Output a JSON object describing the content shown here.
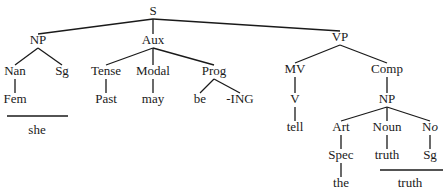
{
  "diagram": {
    "type": "syntax-tree",
    "nodes": [
      {
        "id": "S",
        "label": "S",
        "x": 153,
        "y": 12
      },
      {
        "id": "NP1",
        "label": "NP",
        "x": 38,
        "y": 41
      },
      {
        "id": "Aux",
        "label": "Aux",
        "x": 153,
        "y": 41
      },
      {
        "id": "VP",
        "label": "VP",
        "x": 340,
        "y": 38
      },
      {
        "id": "Nan",
        "label": "Nan",
        "x": 15,
        "y": 72
      },
      {
        "id": "Sg1",
        "label": "Sg",
        "x": 62,
        "y": 72
      },
      {
        "id": "Tense",
        "label": "Tense",
        "x": 106,
        "y": 72
      },
      {
        "id": "Modal",
        "label": "Modal",
        "x": 153,
        "y": 72
      },
      {
        "id": "Prog",
        "label": "Prog",
        "x": 214,
        "y": 72
      },
      {
        "id": "MV",
        "label": "MV",
        "x": 295,
        "y": 70
      },
      {
        "id": "Comp",
        "label": "Comp",
        "x": 387,
        "y": 70
      },
      {
        "id": "Fem",
        "label": "Fem",
        "x": 15,
        "y": 100
      },
      {
        "id": "Past",
        "label": "Past",
        "x": 106,
        "y": 100
      },
      {
        "id": "may",
        "label": "may",
        "x": 153,
        "y": 100
      },
      {
        "id": "be",
        "label": "be",
        "x": 200,
        "y": 100
      },
      {
        "id": "ING",
        "label": "-ING",
        "x": 240,
        "y": 100
      },
      {
        "id": "V",
        "label": "V",
        "x": 295,
        "y": 100
      },
      {
        "id": "NP2",
        "label": "NP",
        "x": 387,
        "y": 100
      },
      {
        "id": "tell",
        "label": "tell",
        "x": 295,
        "y": 128
      },
      {
        "id": "Art",
        "label": "Art",
        "x": 341,
        "y": 128
      },
      {
        "id": "Noun",
        "label": "Noun",
        "x": 387,
        "y": 128
      },
      {
        "id": "No",
        "label": "N",
        "label_suffix_italic": "o",
        "x": 430,
        "y": 128
      },
      {
        "id": "Spec",
        "label": "Spec",
        "x": 341,
        "y": 156
      },
      {
        "id": "truth1",
        "label": "truth",
        "x": 387,
        "y": 156
      },
      {
        "id": "Sg2",
        "label": "Sg",
        "x": 430,
        "y": 156
      },
      {
        "id": "the",
        "label": "the",
        "x": 341,
        "y": 184
      },
      {
        "id": "she",
        "label": "she",
        "x": 37,
        "y": 131
      },
      {
        "id": "truth2",
        "label": "truth",
        "x": 410,
        "y": 184
      }
    ],
    "edges": [
      [
        "S",
        "NP1"
      ],
      [
        "S",
        "Aux"
      ],
      [
        "S",
        "VP"
      ],
      [
        "NP1",
        "Nan"
      ],
      [
        "NP1",
        "Sg1"
      ],
      [
        "Aux",
        "Tense"
      ],
      [
        "Aux",
        "Modal"
      ],
      [
        "Aux",
        "Prog"
      ],
      [
        "VP",
        "MV"
      ],
      [
        "VP",
        "Comp"
      ],
      [
        "Nan",
        "Fem"
      ],
      [
        "Tense",
        "Past"
      ],
      [
        "Modal",
        "may"
      ],
      [
        "Prog",
        "be"
      ],
      [
        "Prog",
        "ING"
      ],
      [
        "MV",
        "V"
      ],
      [
        "Comp",
        "NP2"
      ],
      [
        "V",
        "tell"
      ],
      [
        "NP2",
        "Art"
      ],
      [
        "NP2",
        "Noun"
      ],
      [
        "NP2",
        "No"
      ],
      [
        "Art",
        "Spec"
      ],
      [
        "Noun",
        "truth1"
      ],
      [
        "No",
        "Sg2"
      ],
      [
        "Spec",
        "the"
      ]
    ],
    "realization_bars": [
      {
        "name": "she-bar",
        "x1": 7,
        "x2": 68,
        "y": 116,
        "word": "she"
      },
      {
        "name": "truth-bar",
        "x1": 380,
        "x2": 443,
        "y": 170,
        "word": "truth"
      }
    ]
  }
}
